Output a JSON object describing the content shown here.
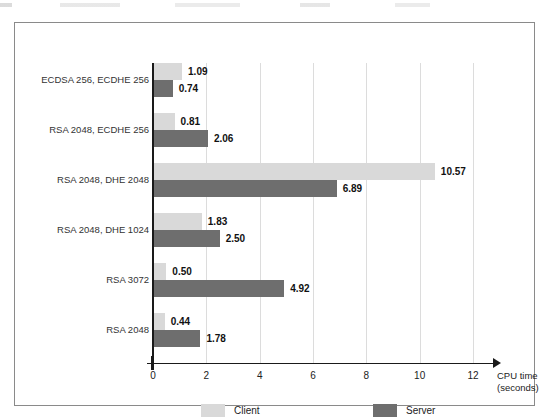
{
  "chart_data": {
    "type": "bar",
    "orientation": "horizontal",
    "title": "",
    "xlabel": "CPU time",
    "xlabel_unit": "(seconds)",
    "ylabel": "",
    "xlim": [
      0,
      12
    ],
    "xticks": [
      "0",
      "2",
      "4",
      "6",
      "8",
      "10",
      "12"
    ],
    "xtick_values": [
      0,
      2,
      4,
      6,
      8,
      10,
      12
    ],
    "grid": true,
    "grid_axis": "x",
    "legend_position": "bottom",
    "categories": [
      "ECDSA 256, ECDHE 256",
      "RSA 2048, ECDHE 256",
      "RSA 2048, DHE 2048",
      "RSA 2048, DHE 1024",
      "RSA 3072",
      "RSA 2048"
    ],
    "series": [
      {
        "name": "Client",
        "color": "#d9d9d9",
        "values": [
          1.09,
          0.81,
          10.57,
          1.83,
          0.5,
          0.44
        ],
        "labels": [
          "1.09",
          "0.81",
          "10.57",
          "1.83",
          "0.50",
          "0.44"
        ]
      },
      {
        "name": "Server",
        "color": "#6e6e6e",
        "values": [
          0.74,
          2.06,
          6.89,
          2.5,
          4.92,
          1.78
        ],
        "labels": [
          "0.74",
          "2.06",
          "6.89",
          "2.50",
          "4.92",
          "1.78"
        ]
      }
    ]
  },
  "legend": {
    "items": [
      {
        "label": "Client",
        "color": "#d9d9d9"
      },
      {
        "label": "Server",
        "color": "#6e6e6e"
      }
    ]
  }
}
